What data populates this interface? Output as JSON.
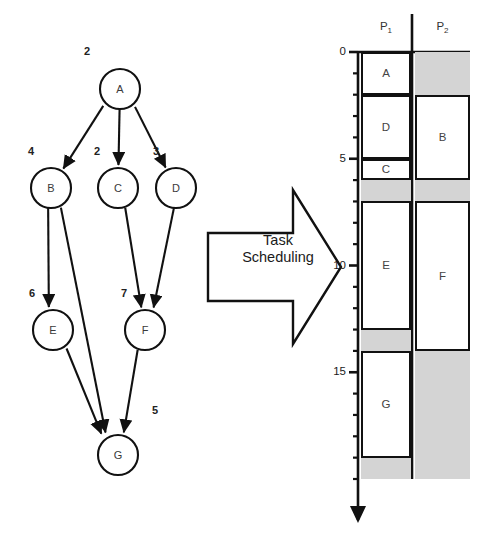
{
  "figure": {
    "transform_label_line1": "Task",
    "transform_label_line2": "Scheduling"
  },
  "task_graph": {
    "type": "dag",
    "node_ids": [
      "A",
      "B",
      "C",
      "D",
      "E",
      "F",
      "G"
    ],
    "nodes": [
      {
        "id": "A",
        "label": "A",
        "weight": "2",
        "cx": 120,
        "cy": 89,
        "r": 20,
        "weight_x": 84,
        "weight_y": 55
      },
      {
        "id": "B",
        "label": "B",
        "weight": "4",
        "cx": 51,
        "cy": 188,
        "r": 20,
        "weight_x": 28,
        "weight_y": 155
      },
      {
        "id": "C",
        "label": "C",
        "weight": "2",
        "cx": 118,
        "cy": 188,
        "r": 20,
        "weight_x": 94,
        "weight_y": 155
      },
      {
        "id": "D",
        "label": "D",
        "weight": "3",
        "cx": 176,
        "cy": 188,
        "r": 20,
        "weight_x": 153,
        "weight_y": 155
      },
      {
        "id": "E",
        "label": "E",
        "weight": "6",
        "cx": 53,
        "cy": 330,
        "r": 20,
        "weight_x": 29,
        "weight_y": 297
      },
      {
        "id": "F",
        "label": "F",
        "weight": "7",
        "cx": 145,
        "cy": 330,
        "r": 20,
        "weight_x": 121,
        "weight_y": 297
      },
      {
        "id": "G",
        "label": "G",
        "weight": "5",
        "cx": 118,
        "cy": 455,
        "r": 20,
        "weight_x": 152,
        "weight_y": 414
      }
    ],
    "edges": [
      {
        "from": "A",
        "to": "B"
      },
      {
        "from": "A",
        "to": "C"
      },
      {
        "from": "A",
        "to": "D"
      },
      {
        "from": "B",
        "to": "E"
      },
      {
        "from": "B",
        "to": "G"
      },
      {
        "from": "C",
        "to": "F"
      },
      {
        "from": "D",
        "to": "F"
      },
      {
        "from": "E",
        "to": "G"
      },
      {
        "from": "F",
        "to": "G"
      }
    ]
  },
  "schedule": {
    "axis": {
      "label_ticks": [
        "0",
        "5",
        "10",
        "15"
      ],
      "label_tick_values": [
        0,
        5,
        10,
        15
      ],
      "minor_tick_step": 1,
      "range": [
        0,
        20
      ],
      "direction": "downward",
      "arrow": true
    },
    "processors": [
      {
        "id": "P1",
        "label": "P",
        "sub": "1"
      },
      {
        "id": "P2",
        "label": "P",
        "sub": "2"
      }
    ],
    "blocks": [
      {
        "processor": "P1",
        "task": "A",
        "start": 0,
        "end": 2,
        "idle": false
      },
      {
        "processor": "P1",
        "task": "D",
        "start": 2,
        "end": 5,
        "idle": false
      },
      {
        "processor": "P1",
        "task": "C",
        "start": 5,
        "end": 6,
        "idle": false
      },
      {
        "processor": "P1",
        "task": "",
        "start": 6,
        "end": 7,
        "idle": true
      },
      {
        "processor": "P1",
        "task": "E",
        "start": 7,
        "end": 13,
        "idle": false
      },
      {
        "processor": "P1",
        "task": "",
        "start": 13,
        "end": 14,
        "idle": true
      },
      {
        "processor": "P1",
        "task": "G",
        "start": 14,
        "end": 19,
        "idle": false
      },
      {
        "processor": "P1",
        "task": "",
        "start": 19,
        "end": 20,
        "idle": true
      },
      {
        "processor": "P2",
        "task": "",
        "start": 0,
        "end": 2,
        "idle": true
      },
      {
        "processor": "P2",
        "task": "B",
        "start": 2,
        "end": 6,
        "idle": false
      },
      {
        "processor": "P2",
        "task": "",
        "start": 6,
        "end": 7,
        "idle": true
      },
      {
        "processor": "P2",
        "task": "F",
        "start": 7,
        "end": 14,
        "idle": false
      },
      {
        "processor": "P2",
        "task": "",
        "start": 14,
        "end": 20,
        "idle": true
      }
    ]
  },
  "colors": {
    "line": "#111111",
    "idle_fill": "#d4d4d4",
    "block_fill": "#ffffff",
    "text": "#333333"
  }
}
